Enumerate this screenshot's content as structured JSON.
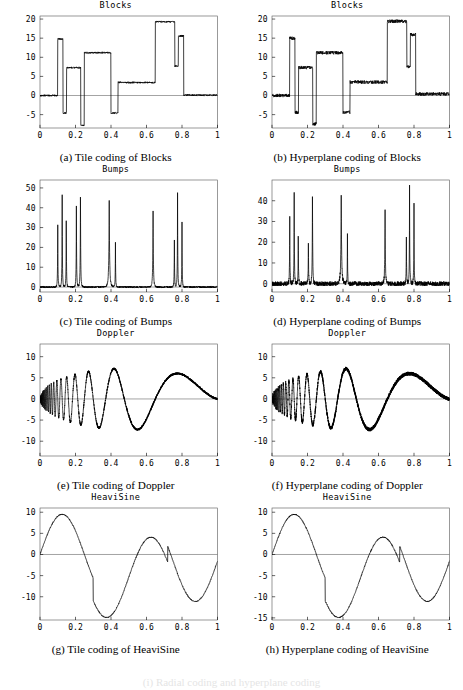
{
  "figure": {
    "background": "#ffffff",
    "ink": "#000000",
    "frame_color": "#555555",
    "bleed_text": "(i) Radial coding and hyperplane coding"
  },
  "panels": [
    {
      "id": "a",
      "title": "Blocks",
      "caption": "(a) Tile coding of Blocks",
      "xlabel": "",
      "ylabel": "",
      "xticks": [
        "0",
        "0.2",
        "0.4",
        "0.6",
        "0.8",
        "1"
      ],
      "yticks": [
        "20",
        "15",
        "10",
        "5",
        "0",
        "-5"
      ]
    },
    {
      "id": "b",
      "title": "Blocks",
      "caption": "(b) Hyperplane coding of Blocks",
      "xlabel": "",
      "ylabel": "",
      "xticks": [
        "0",
        "0.2",
        "0.4",
        "0.6",
        "0.8",
        "1"
      ],
      "yticks": [
        "20",
        "15",
        "10",
        "5",
        "0",
        "-5"
      ]
    },
    {
      "id": "c",
      "title": "Bumps",
      "caption": "(c) Tile coding of Bumps",
      "xlabel": "",
      "ylabel": "",
      "xticks": [
        "0",
        "0.2",
        "0.4",
        "0.6",
        "0.8",
        "1"
      ],
      "yticks": [
        "50",
        "40",
        "30",
        "20",
        "10",
        "0"
      ]
    },
    {
      "id": "d",
      "title": "Bumps",
      "caption": "(d) Hyperplane coding of Bumps",
      "xlabel": "",
      "ylabel": "",
      "xticks": [
        "0",
        "0.2",
        "0.4",
        "0.6",
        "0.8",
        "1"
      ],
      "yticks": [
        "40",
        "30",
        "20",
        "10",
        "0"
      ]
    },
    {
      "id": "e",
      "title": "Doppler",
      "caption": "(e) Tile coding of Doppler",
      "xlabel": "",
      "ylabel": "",
      "xticks": [
        "0",
        "0.2",
        "0.4",
        "0.6",
        "0.8",
        "1"
      ],
      "yticks": [
        "10",
        "5",
        "0",
        "-5",
        "-10"
      ]
    },
    {
      "id": "f",
      "title": "Doppler",
      "caption": "(f) Hyperplane coding of Doppler",
      "xlabel": "",
      "ylabel": "",
      "xticks": [
        "0",
        "0.2",
        "0.4",
        "0.6",
        "0.8",
        "1"
      ],
      "yticks": [
        "10",
        "5",
        "0",
        "-5",
        "-10"
      ]
    },
    {
      "id": "g",
      "title": "HeaviSine",
      "caption": "(g) Tile coding of HeaviSine",
      "xlabel": "",
      "ylabel": "",
      "xticks": [
        "0",
        "0.2",
        "0.4",
        "0.6",
        "0.8",
        "1"
      ],
      "yticks": [
        "10",
        "5",
        "0",
        "-5",
        "-10"
      ]
    },
    {
      "id": "h",
      "title": "HeaviSine",
      "caption": "(h) Hyperplane coding of HeaviSine",
      "xlabel": "",
      "ylabel": "",
      "xticks": [
        "0",
        "0.2",
        "0.4",
        "0.6",
        "0.8",
        "1"
      ],
      "yticks": [
        "10",
        "5",
        "0",
        "-5",
        "-10",
        "-15"
      ]
    }
  ],
  "chart_data": [
    {
      "id": "a",
      "type": "line",
      "title": "Blocks",
      "xlabel": "",
      "ylabel": "",
      "xlim": [
        0,
        1
      ],
      "ylim": [
        -8.5,
        20.8
      ],
      "grid": false,
      "legend": "none",
      "noise": 0.22,
      "signal": "blocks",
      "blocks": [
        {
          "x0": 0.0,
          "x1": 0.1,
          "y": 0.0
        },
        {
          "x0": 0.1,
          "x1": 0.13,
          "y": 14.8
        },
        {
          "x0": 0.13,
          "x1": 0.15,
          "y": -4.6
        },
        {
          "x0": 0.15,
          "x1": 0.23,
          "y": 7.3
        },
        {
          "x0": 0.23,
          "x1": 0.25,
          "y": -7.8
        },
        {
          "x0": 0.25,
          "x1": 0.4,
          "y": 11.2
        },
        {
          "x0": 0.4,
          "x1": 0.44,
          "y": -4.6
        },
        {
          "x0": 0.44,
          "x1": 0.65,
          "y": 3.4
        },
        {
          "x0": 0.65,
          "x1": 0.76,
          "y": 19.3
        },
        {
          "x0": 0.76,
          "x1": 0.78,
          "y": 7.7
        },
        {
          "x0": 0.78,
          "x1": 0.81,
          "y": 15.6
        },
        {
          "x0": 0.81,
          "x1": 1.0,
          "y": 0.1
        }
      ]
    },
    {
      "id": "b",
      "type": "line",
      "title": "Blocks",
      "xlabel": "",
      "ylabel": "",
      "xlim": [
        0,
        1
      ],
      "ylim": [
        -8.5,
        20.8
      ],
      "grid": false,
      "legend": "none",
      "noise": 0.45,
      "signal": "blocks",
      "blocks": [
        {
          "x0": 0.0,
          "x1": 0.1,
          "y": 0.0
        },
        {
          "x0": 0.1,
          "x1": 0.13,
          "y": 15.0
        },
        {
          "x0": 0.13,
          "x1": 0.15,
          "y": -4.4
        },
        {
          "x0": 0.15,
          "x1": 0.23,
          "y": 7.3
        },
        {
          "x0": 0.23,
          "x1": 0.25,
          "y": -7.4
        },
        {
          "x0": 0.25,
          "x1": 0.4,
          "y": 11.2
        },
        {
          "x0": 0.4,
          "x1": 0.44,
          "y": -4.4
        },
        {
          "x0": 0.44,
          "x1": 0.65,
          "y": 3.5
        },
        {
          "x0": 0.65,
          "x1": 0.76,
          "y": 19.4
        },
        {
          "x0": 0.76,
          "x1": 0.78,
          "y": 7.6
        },
        {
          "x0": 0.78,
          "x1": 0.81,
          "y": 15.9
        },
        {
          "x0": 0.81,
          "x1": 1.0,
          "y": 0.4
        }
      ]
    },
    {
      "id": "c",
      "type": "line",
      "title": "Bumps",
      "xlabel": "",
      "ylabel": "",
      "xlim": [
        0,
        1
      ],
      "ylim": [
        -2.5,
        54
      ],
      "grid": false,
      "legend": "none",
      "noise": 0.45,
      "signal": "bumps",
      "bumps": [
        {
          "x": 0.1,
          "h": 31.0,
          "w": 0.0045
        },
        {
          "x": 0.125,
          "h": 46.5,
          "w": 0.0045
        },
        {
          "x": 0.148,
          "h": 38.5,
          "w": 0.004
        },
        {
          "x": 0.205,
          "h": 40.5,
          "w": 0.0048
        },
        {
          "x": 0.228,
          "h": 51.0,
          "w": 0.0048
        },
        {
          "x": 0.39,
          "h": 43.5,
          "w": 0.0085
        },
        {
          "x": 0.425,
          "h": 23.0,
          "w": 0.004
        },
        {
          "x": 0.637,
          "h": 42.5,
          "w": 0.006
        },
        {
          "x": 0.757,
          "h": 27.0,
          "w": 0.004
        },
        {
          "x": 0.775,
          "h": 47.5,
          "w": 0.0045
        },
        {
          "x": 0.8,
          "h": 32.5,
          "w": 0.0042
        }
      ]
    },
    {
      "id": "d",
      "type": "line",
      "title": "Bumps",
      "xlabel": "",
      "ylabel": "",
      "xlim": [
        0,
        1
      ],
      "ylim": [
        -4.0,
        50
      ],
      "grid": false,
      "legend": "none",
      "noise": 1.1,
      "signal": "bumps",
      "bumps": [
        {
          "x": 0.1,
          "h": 31.5,
          "w": 0.0045
        },
        {
          "x": 0.125,
          "h": 45.0,
          "w": 0.0045
        },
        {
          "x": 0.148,
          "h": 25.5,
          "w": 0.004
        },
        {
          "x": 0.205,
          "h": 20.5,
          "w": 0.0048
        },
        {
          "x": 0.228,
          "h": 47.0,
          "w": 0.005
        },
        {
          "x": 0.39,
          "h": 42.0,
          "w": 0.0085
        },
        {
          "x": 0.425,
          "h": 24.0,
          "w": 0.004
        },
        {
          "x": 0.637,
          "h": 39.5,
          "w": 0.006
        },
        {
          "x": 0.757,
          "h": 25.0,
          "w": 0.004
        },
        {
          "x": 0.775,
          "h": 46.5,
          "w": 0.0045
        },
        {
          "x": 0.8,
          "h": 38.5,
          "w": 0.0042
        }
      ]
    },
    {
      "id": "e",
      "type": "line",
      "title": "Doppler",
      "xlabel": "",
      "ylabel": "",
      "xlim": [
        0,
        1
      ],
      "ylim": [
        -13.5,
        13.0
      ],
      "grid": false,
      "legend": "none",
      "noise": 0.25,
      "signal": "doppler",
      "amplitude": 13.0,
      "epsilon": 0.05
    },
    {
      "id": "f",
      "type": "line",
      "title": "Doppler",
      "xlabel": "",
      "ylabel": "",
      "xlim": [
        0,
        1
      ],
      "ylim": [
        -13.5,
        13.0
      ],
      "grid": false,
      "legend": "none",
      "noise": 0.45,
      "signal": "doppler",
      "amplitude": 13.0,
      "epsilon": 0.05
    },
    {
      "id": "g",
      "type": "line",
      "title": "HeaviSine",
      "xlabel": "",
      "ylabel": "",
      "xlim": [
        0,
        1
      ],
      "ylim": [
        -15.5,
        11.0
      ],
      "grid": false,
      "legend": "none",
      "noise": 0.12,
      "signal": "heavisine",
      "amplitude": 10.0,
      "jumps": [
        {
          "x": 0.3,
          "delta": -5.4
        },
        {
          "x": 0.72,
          "delta": 3.8
        }
      ]
    },
    {
      "id": "h",
      "type": "line",
      "title": "HeaviSine",
      "xlabel": "",
      "ylabel": "",
      "xlim": [
        0,
        1
      ],
      "ylim": [
        -15.5,
        11.0
      ],
      "grid": false,
      "legend": "none",
      "noise": 0.12,
      "signal": "heavisine",
      "amplitude": 10.0,
      "jumps": [
        {
          "x": 0.3,
          "delta": -5.4
        },
        {
          "x": 0.72,
          "delta": 3.8
        }
      ]
    }
  ]
}
